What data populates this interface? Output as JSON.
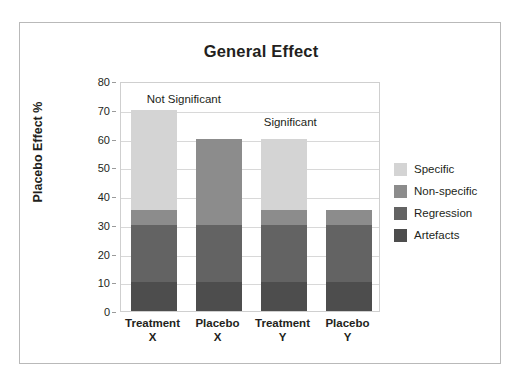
{
  "figure": {
    "title": "General Effect",
    "background": "#ffffff",
    "frame_color": "#b9b9b9"
  },
  "chart_data": {
    "type": "bar",
    "stacked": true,
    "title": "General Effect",
    "xlabel": "",
    "ylabel": "Placebo Effect %",
    "ylim": [
      0,
      80
    ],
    "ytick_step": 10,
    "yticks": [
      0,
      10,
      20,
      30,
      40,
      50,
      60,
      70,
      80
    ],
    "ytick_labels": [
      "0",
      "10",
      "20",
      "30",
      "40",
      "50",
      "60",
      "70",
      "80"
    ],
    "grid": true,
    "grid_axis": "y",
    "legend_position": "right",
    "categories": [
      "Treatment X",
      "Placebo X",
      "Treatment Y",
      "Placebo Y"
    ],
    "category_lines": [
      [
        "Treatment",
        "X"
      ],
      [
        "Placebo",
        "X"
      ],
      [
        "Treatment",
        "Y"
      ],
      [
        "Placebo",
        "Y"
      ]
    ],
    "series": [
      {
        "name": "Artefacts",
        "color": "#4d4d4d",
        "values": [
          10,
          10,
          10,
          10
        ]
      },
      {
        "name": "Regression",
        "color": "#636363",
        "values": [
          20,
          20,
          20,
          20
        ]
      },
      {
        "name": "Non-specific",
        "color": "#8c8c8c",
        "values": [
          5,
          30,
          5,
          5
        ]
      },
      {
        "name": "Specific",
        "color": "#d4d4d4",
        "values": [
          35,
          0,
          25,
          0
        ]
      }
    ],
    "totals": [
      70,
      60,
      60,
      35
    ],
    "annotations": [
      {
        "text": "Not Significant",
        "x_value": 0.25,
        "y_value": 74
      },
      {
        "text": "Significant",
        "x_value": 2.05,
        "y_value": 66
      }
    ]
  },
  "legend": {
    "items": [
      {
        "label": "Specific",
        "color": "#d4d4d4"
      },
      {
        "label": "Non-specific",
        "color": "#8c8c8c"
      },
      {
        "label": "Regression",
        "color": "#636363"
      },
      {
        "label": "Artefacts",
        "color": "#4d4d4d"
      }
    ]
  },
  "annotations": {
    "not_significant": "Not Significant",
    "significant": "Significant"
  }
}
